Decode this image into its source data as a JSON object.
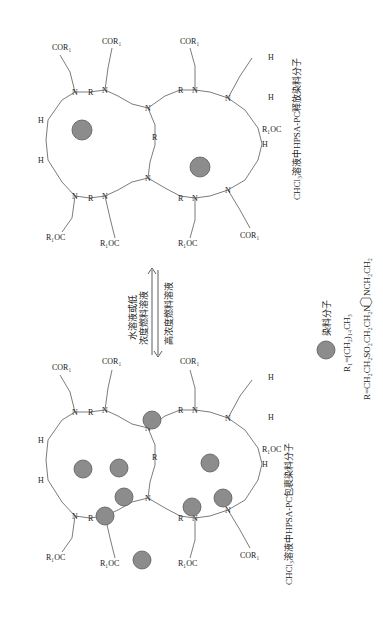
{
  "figure": {
    "rotation_deg": -90,
    "top_molecule": {
      "caption": "CHCl₃溶液中HPSA-PC释放染料分子",
      "state": "release",
      "dye_count": 2
    },
    "bottom_molecule": {
      "caption": "CHCl₃溶液中HPSA-PC包裹染料分子",
      "state": "encapsulate",
      "dye_count": 8
    },
    "arrows": {
      "forward_label_line1": "水溶液或低",
      "forward_label_line2": "浓度燃料溶液",
      "reverse_label": "高浓度燃料溶液"
    },
    "legend": {
      "dye_label": "染料分子",
      "r1_def": "R₁=(CH₂)₁₄CH₃",
      "r_def_prefix": "R=CH₂CH₂SO₂CH₂CH₂N",
      "r_def_suffix": "NCH₂CH₂"
    },
    "atoms": {
      "N": "N",
      "R": "R",
      "H": "H",
      "COR1": "COR₁",
      "R1OC": "R₁OC"
    },
    "colors": {
      "dye_fill": "#8c8c8c",
      "dye_stroke": "#5a5a5a",
      "line": "#444444",
      "text": "#222222"
    }
  }
}
